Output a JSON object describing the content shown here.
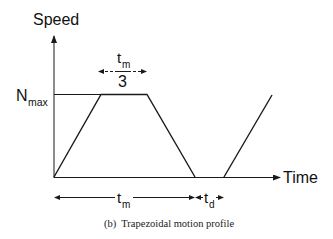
{
  "diagram": {
    "y_axis_label": "Speed",
    "x_axis_label": "Time",
    "level_label_main": "N",
    "level_label_sub": "max",
    "top_interval_label_main": "t",
    "top_interval_label_sub": "m",
    "top_interval_divisor": "3",
    "bottom_interval_1_main": "t",
    "bottom_interval_1_sub": "m",
    "bottom_interval_2_main": "t",
    "bottom_interval_2_sub": "d",
    "caption": "(b)  Trapezoidal motion profile",
    "line_color": "#1a1a1a"
  }
}
